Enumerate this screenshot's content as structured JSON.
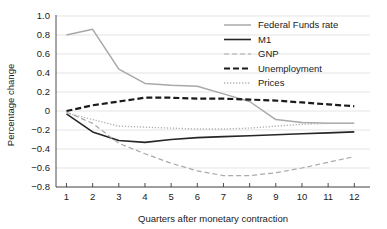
{
  "chart_data": {
    "type": "line",
    "title": "",
    "xlabel": "Quarters after monetary contraction",
    "ylabel": "Percentage change",
    "x": [
      1,
      2,
      3,
      4,
      5,
      6,
      7,
      8,
      9,
      10,
      11,
      12
    ],
    "xticklabels": [
      "1",
      "2",
      "3",
      "4",
      "5",
      "6",
      "7",
      "8",
      "9",
      "10",
      "11",
      "12"
    ],
    "yticklabels": [
      "1.0",
      "0.8",
      "0.6",
      "0.4",
      "0.2",
      "0",
      "-0.2",
      "-0.4",
      "-0.6",
      "-0.8"
    ],
    "yticks": [
      1.0,
      0.8,
      0.6,
      0.4,
      0.2,
      0,
      -0.2,
      -0.4,
      -0.6,
      -0.8
    ],
    "xlim": [
      0.6,
      12.6
    ],
    "ylim": [
      -0.8,
      1.0
    ],
    "grid": true,
    "legend_position": "top-right",
    "series": [
      {
        "name": "Federal Funds rate",
        "color": "#a8a8a8",
        "width": 1.5,
        "dash": "none",
        "values": [
          0.8,
          0.86,
          0.44,
          0.29,
          0.27,
          0.26,
          0.18,
          0.1,
          -0.09,
          -0.12,
          -0.13,
          -0.13
        ]
      },
      {
        "name": "M1",
        "color": "#262626",
        "width": 1.6,
        "dash": "none",
        "values": [
          -0.03,
          -0.22,
          -0.31,
          -0.33,
          -0.3,
          -0.28,
          -0.27,
          -0.26,
          -0.25,
          -0.24,
          -0.23,
          -0.22
        ]
      },
      {
        "name": "GNP",
        "color": "#aaaaaa",
        "width": 1.2,
        "dash": "5,3",
        "values": [
          -0.01,
          -0.13,
          -0.34,
          -0.45,
          -0.55,
          -0.63,
          -0.68,
          -0.68,
          -0.65,
          -0.6,
          -0.54,
          -0.48
        ]
      },
      {
        "name": "Unemployment",
        "color": "#1a1a1a",
        "width": 2.2,
        "dash": "6,3",
        "values": [
          0.0,
          0.06,
          0.1,
          0.14,
          0.14,
          0.13,
          0.13,
          0.12,
          0.11,
          0.09,
          0.07,
          0.05
        ]
      },
      {
        "name": "Prices",
        "color": "#b4b4b4",
        "width": 1.4,
        "dash": "1.3,1.7",
        "values": [
          -0.02,
          -0.09,
          -0.16,
          -0.17,
          -0.18,
          -0.19,
          -0.19,
          -0.18,
          -0.16,
          -0.14,
          -0.13,
          -0.13
        ]
      }
    ]
  },
  "legend": {
    "items": [
      {
        "label": "Federal Funds rate"
      },
      {
        "label": "M1"
      },
      {
        "label": "GNP"
      },
      {
        "label": "Unemployment"
      },
      {
        "label": "Prices"
      }
    ]
  }
}
